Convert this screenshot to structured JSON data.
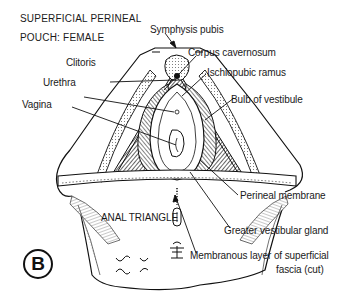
{
  "figure": {
    "title_line1": "SUPERFICIAL PERINEAL",
    "title_line2": "POUCH: FEMALE",
    "panel_letter": "B",
    "region_label": "ANAL TRIANGLE",
    "labels": {
      "symphysis_pubis": "Symphysis pubis",
      "corpus_cavernosum": "Corpus cavernosum",
      "ischiopubic_ramus": "Ischiopubic ramus",
      "clitoris": "Clitoris",
      "urethra": "Urethra",
      "vagina": "Vagina",
      "bulb_of_vestibule": "Bulb of vestibule",
      "perineal_membrane": "Perineal membrane",
      "greater_vestibular_gland": "Greater vestibular gland",
      "membranous_layer_line1": "Membranous layer of superficial",
      "membranous_layer_line2": "fascia (cut)"
    },
    "colors": {
      "ink": "#111111",
      "background": "#ffffff",
      "shade": "#555555"
    }
  }
}
